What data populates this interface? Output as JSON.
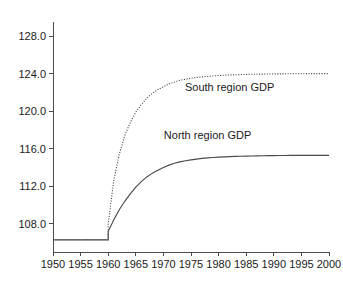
{
  "chart_data": {
    "type": "line",
    "title": "",
    "subtitle": "",
    "xlabel": "",
    "ylabel": "",
    "xlim": [
      1950,
      2000
    ],
    "ylim": [
      105.0,
      129.5
    ],
    "grid": false,
    "legend_position": "inline-annotation",
    "x_ticks": [
      1950,
      1955,
      1960,
      1965,
      1970,
      1975,
      1980,
      1985,
      1990,
      1995,
      2000
    ],
    "x_tick_labels": [
      "1950",
      "1955",
      "1960",
      "1965",
      "1970",
      "1975",
      "1980",
      "1985",
      "1990",
      "1995",
      "2000"
    ],
    "y_ticks": [
      108.0,
      112.0,
      116.0,
      120.0,
      124.0,
      128.0
    ],
    "y_tick_labels": [
      "108.0",
      "112.0",
      "116.0",
      "120.0",
      "124.0",
      "128.0"
    ],
    "annotations": [
      {
        "text": "South region GDP",
        "x": 1982,
        "y": 122.2
      },
      {
        "text": "North region GDP",
        "x": 1978,
        "y": 117.0
      }
    ],
    "series": [
      {
        "name": "South region GDP",
        "style": "dotted",
        "color": "#4a4a4a",
        "x": [
          1950,
          1951,
          1952,
          1953,
          1954,
          1955,
          1956,
          1957,
          1958,
          1959,
          1960,
          1960,
          1961,
          1962,
          1963,
          1964,
          1965,
          1966,
          1967,
          1968,
          1969,
          1970,
          1971,
          1972,
          1973,
          1974,
          1975,
          1976,
          1977,
          1978,
          1979,
          1980,
          1981,
          1982,
          1983,
          1984,
          1985,
          1986,
          1987,
          1988,
          1989,
          1990,
          1991,
          1992,
          1993,
          1994,
          1995,
          1996,
          1997,
          1998,
          1999,
          2000
        ],
        "values": [
          106.3,
          106.3,
          106.3,
          106.3,
          106.3,
          106.3,
          106.3,
          106.3,
          106.3,
          106.3,
          106.3,
          108.0,
          112.6,
          115.4,
          117.4,
          118.8,
          119.9,
          120.7,
          121.4,
          121.9,
          122.3,
          122.6,
          122.9,
          123.1,
          123.3,
          123.4,
          123.5,
          123.6,
          123.65,
          123.7,
          123.75,
          123.8,
          123.83,
          123.86,
          123.88,
          123.9,
          123.92,
          123.93,
          123.94,
          123.95,
          123.96,
          123.97,
          123.97,
          123.98,
          123.98,
          123.99,
          123.99,
          124.0,
          124.0,
          124.0,
          124.0,
          124.0
        ]
      },
      {
        "name": "North region GDP",
        "style": "solid",
        "color": "#4a4a4a",
        "x": [
          1950,
          1951,
          1952,
          1953,
          1954,
          1955,
          1956,
          1957,
          1958,
          1959,
          1960,
          1960,
          1961,
          1962,
          1963,
          1964,
          1965,
          1966,
          1967,
          1968,
          1969,
          1970,
          1971,
          1972,
          1973,
          1974,
          1975,
          1976,
          1977,
          1978,
          1979,
          1980,
          1981,
          1982,
          1983,
          1984,
          1985,
          1986,
          1987,
          1988,
          1989,
          1990,
          1991,
          1992,
          1993,
          1994,
          1995,
          1996,
          1997,
          1998,
          1999,
          2000
        ],
        "values": [
          106.3,
          106.3,
          106.3,
          106.3,
          106.3,
          106.3,
          106.3,
          106.3,
          106.3,
          106.3,
          106.3,
          107.2,
          108.4,
          109.5,
          110.4,
          111.2,
          111.9,
          112.5,
          113.0,
          113.4,
          113.7,
          114.0,
          114.25,
          114.45,
          114.6,
          114.72,
          114.82,
          114.9,
          114.97,
          115.02,
          115.07,
          115.1,
          115.13,
          115.16,
          115.18,
          115.2,
          115.22,
          115.23,
          115.24,
          115.25,
          115.26,
          115.27,
          115.28,
          115.28,
          115.29,
          115.29,
          115.3,
          115.3,
          115.3,
          115.3,
          115.3,
          115.3
        ]
      }
    ]
  },
  "axes": {
    "y_axis_name": "y-axis",
    "x_axis_name": "x-axis"
  }
}
